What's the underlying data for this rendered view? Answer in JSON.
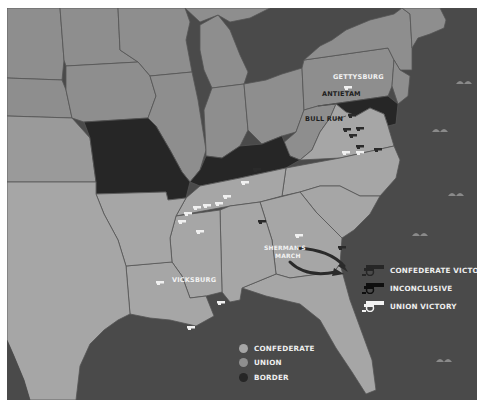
{
  "map": {
    "title": "Civil War Battles Map",
    "colors": {
      "ocean": "#4a4a4a",
      "confederate": "#a6a6a6",
      "union": "#8e8e8e",
      "border": "#262626",
      "state_line": "#555555",
      "frame": "#ffffff"
    }
  },
  "battles": [
    {
      "label": "GETTYSBURG",
      "result": "union"
    },
    {
      "label": "ANTIETAM",
      "result": "inconclusive"
    },
    {
      "label": "BULL RUN",
      "result": "confederate"
    },
    {
      "label": "VICKSBURG",
      "result": "union"
    },
    {
      "label": "SHERMAN'S",
      "result": "union"
    },
    {
      "label": "MARCH",
      "result": "union"
    }
  ],
  "annotations": {
    "gettysburg": "GETTYSBURG",
    "antietam": "ANTIETAM",
    "bull_run": "BULL RUN",
    "vicksburg": "VICKSBURG",
    "shermans_line1": "SHERMAN'S",
    "shermans_line2": "MARCH"
  },
  "legend_battles": {
    "items": [
      {
        "label": "CONFEDERATE VICTORY",
        "icon": "cannon-icon",
        "color": "#262626"
      },
      {
        "label": "INCONCLUSIVE",
        "icon": "cannon-icon",
        "color": "#111111"
      },
      {
        "label": "UNION VICTORY",
        "icon": "cannon-icon",
        "color": "#f2f2f2"
      }
    ]
  },
  "legend_states": {
    "items": [
      {
        "label": "CONFEDERATE",
        "color": "#a6a6a6"
      },
      {
        "label": "UNION",
        "color": "#8e8e8e"
      },
      {
        "label": "BORDER",
        "color": "#262626"
      }
    ]
  }
}
